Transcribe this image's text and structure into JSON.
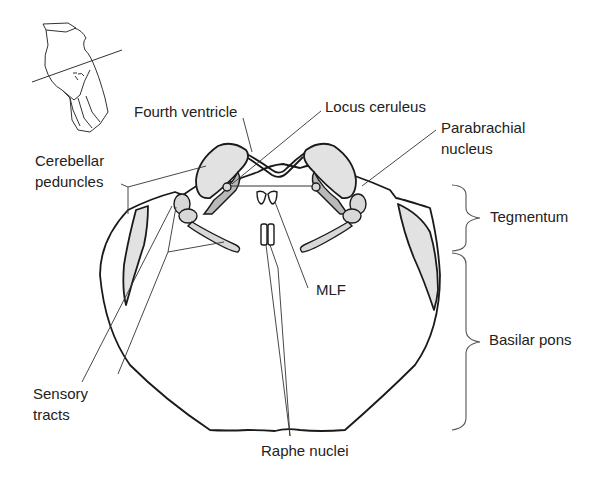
{
  "figure": {
    "inset": "Brainstem with section plane line"
  },
  "labels": {
    "fourth_ventricle": "Fourth ventricle",
    "locus_ceruleus": "Locus ceruleus",
    "parabrachial_line1": "Parabrachial",
    "parabrachial_line2": "nucleus",
    "cerebellar_line1": "Cerebellar",
    "cerebellar_line2": "peduncles",
    "tegmentum": "Tegmentum",
    "mlf": "MLF",
    "basilar_pons": "Basilar pons",
    "sensory_line1": "Sensory",
    "sensory_line2": "tracts",
    "raphe_nuclei": "Raphe nuclei"
  },
  "colors": {
    "stroke": "#1a1a1a",
    "shade": "#e2e2e2",
    "dark_shade": "#b9b9b9",
    "text": "#222222"
  }
}
